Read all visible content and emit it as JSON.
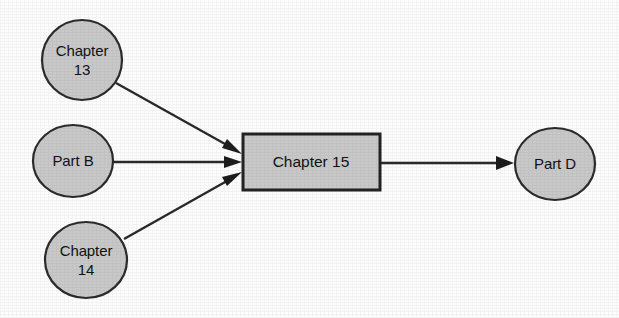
{
  "diagram": {
    "background_color": "#fdfdfd",
    "node_fill_color": "#c9c9c9",
    "node_stroke_color": "#2b2b2b",
    "edge_color": "#2a2a2a",
    "text_color": "#121212",
    "nodes": [
      {
        "id": "chapter-13",
        "shape": "ellipse",
        "label": "Chapter 13",
        "label_line_1": "Chapter",
        "label_line_2": "13",
        "cx": 82,
        "cy": 60,
        "rx": 40,
        "ry": 40
      },
      {
        "id": "part-b",
        "shape": "ellipse",
        "label": "Part B",
        "label_line_1": "Part B",
        "label_line_2": "",
        "cx": 73,
        "cy": 161,
        "rx": 40,
        "ry": 36
      },
      {
        "id": "chapter-14",
        "shape": "ellipse",
        "label": "Chapter 14",
        "label_line_1": "Chapter",
        "label_line_2": "14",
        "cx": 86,
        "cy": 260,
        "rx": 41,
        "ry": 38
      },
      {
        "id": "chapter-15",
        "shape": "rectangle",
        "label": "Chapter 15",
        "label_line_1": "Chapter 15",
        "label_line_2": "",
        "x": 243,
        "y": 134,
        "width": 137,
        "height": 56
      },
      {
        "id": "part-d",
        "shape": "ellipse",
        "label": "Part D",
        "label_line_1": "Part D",
        "label_line_2": "",
        "cx": 555,
        "cy": 164,
        "rx": 40,
        "ry": 36
      }
    ],
    "edges": [
      {
        "id": "edge-chapter13-to-chapter15",
        "from": "chapter-13",
        "to": "chapter-15",
        "label": "",
        "x1": 116,
        "y1": 83,
        "x2": 240,
        "y2": 152
      },
      {
        "id": "edge-partb-to-chapter15",
        "from": "part-b",
        "to": "chapter-15",
        "label": "",
        "x1": 113,
        "y1": 162,
        "x2": 240,
        "y2": 162
      },
      {
        "id": "edge-chapter14-to-chapter15",
        "from": "chapter-14",
        "to": "chapter-15",
        "label": "",
        "x1": 124,
        "y1": 239,
        "x2": 240,
        "y2": 172
      },
      {
        "id": "edge-chapter15-to-partd",
        "from": "chapter-15",
        "to": "part-d",
        "label": "",
        "x1": 380,
        "y1": 163,
        "x2": 513,
        "y2": 163
      }
    ]
  }
}
